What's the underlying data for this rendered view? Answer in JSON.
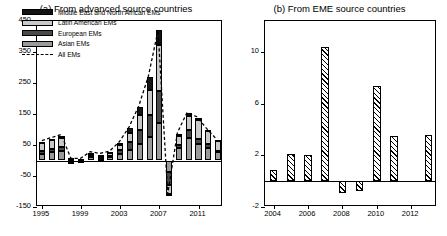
{
  "figure": {
    "panels": [
      {
        "id": "a",
        "title": "(a) From advanced source countries"
      },
      {
        "id": "b",
        "title": "(b) From EME source countries"
      }
    ]
  },
  "legend": {
    "items": [
      {
        "label": "Middle East and North African EMs",
        "color": "#141414",
        "style": "fill"
      },
      {
        "label": "Latin American EMs",
        "color": "#c9c9c9",
        "style": "fill"
      },
      {
        "label": "European EMs",
        "color": "#4a4a4a",
        "style": "fill"
      },
      {
        "label": "Asian EMs",
        "color": "#9a9a9a",
        "style": "fill"
      },
      {
        "label": "All EMs",
        "color": "#000000",
        "style": "dashed-line"
      }
    ]
  },
  "chart_data": [
    {
      "type": "bar",
      "subtype": "stacked-bar-with-line",
      "panel": "a",
      "title": "(a) From advanced source countries",
      "xlabel": "",
      "ylabel": "",
      "grid": false,
      "legend_position": "top-left-inside",
      "ylim": [
        -150,
        450
      ],
      "yticks": [
        -150,
        -50,
        50,
        150,
        250,
        350,
        450
      ],
      "ytick_labels": [
        "-150",
        "-50",
        "50",
        "150",
        "250",
        "350",
        "450"
      ],
      "xticks": [
        1995,
        1999,
        2003,
        2007,
        2011
      ],
      "xtick_labels": [
        "1995",
        "1999",
        "2003",
        "2007",
        "2011"
      ],
      "categories": [
        1995,
        1996,
        1997,
        1998,
        1999,
        2000,
        2001,
        2002,
        2003,
        2004,
        2005,
        2006,
        2007,
        2008,
        2009,
        2010,
        2011,
        2012,
        2013
      ],
      "series": [
        {
          "name": "Asian EMs",
          "color": "#9a9a9a",
          "values": [
            22,
            26,
            30,
            6,
            4,
            10,
            6,
            10,
            20,
            34,
            52,
            76,
            120,
            -36,
            40,
            74,
            52,
            40,
            26
          ]
        },
        {
          "name": "European EMs",
          "color": "#4a4a4a",
          "values": [
            8,
            10,
            12,
            -4,
            -2,
            4,
            4,
            6,
            14,
            26,
            46,
            72,
            104,
            -42,
            10,
            24,
            18,
            12,
            6
          ]
        },
        {
          "name": "Latin American EMs",
          "color": "#c9c9c9",
          "values": [
            26,
            30,
            32,
            2,
            2,
            8,
            6,
            8,
            16,
            30,
            48,
            78,
            150,
            -30,
            30,
            44,
            60,
            42,
            30
          ]
        },
        {
          "name": "Middle East and North African EMs",
          "color": "#141414",
          "values": [
            4,
            4,
            6,
            -2,
            -2,
            2,
            2,
            2,
            6,
            14,
            26,
            44,
            46,
            -6,
            6,
            10,
            8,
            6,
            4
          ]
        }
      ],
      "line_series": {
        "name": "All EMs",
        "style": "dashed",
        "color": "#000000",
        "values": [
          60,
          70,
          80,
          2,
          2,
          24,
          18,
          26,
          56,
          104,
          172,
          270,
          420,
          -114,
          86,
          152,
          138,
          100,
          66
        ]
      }
    },
    {
      "type": "bar",
      "panel": "b",
      "title": "(b) From EME source countries",
      "xlabel": "",
      "ylabel": "",
      "grid": false,
      "hatch": "diagonal",
      "ylim": [
        -2,
        12.4
      ],
      "yticks": [
        -2,
        2,
        6,
        10
      ],
      "ytick_labels": [
        "-2",
        "2",
        "6",
        "10"
      ],
      "xticks": [
        2004,
        2006,
        2008,
        2010,
        2012
      ],
      "xtick_labels": [
        "2004",
        "2006",
        "2008",
        "2010",
        "2012"
      ],
      "categories": [
        2004,
        2005,
        2006,
        2007,
        2008,
        2009,
        2010,
        2011,
        2012,
        2013
      ],
      "values": [
        0.9,
        2.1,
        2.0,
        10.4,
        -0.9,
        -0.8,
        7.4,
        3.5,
        0.0,
        3.6
      ]
    }
  ]
}
